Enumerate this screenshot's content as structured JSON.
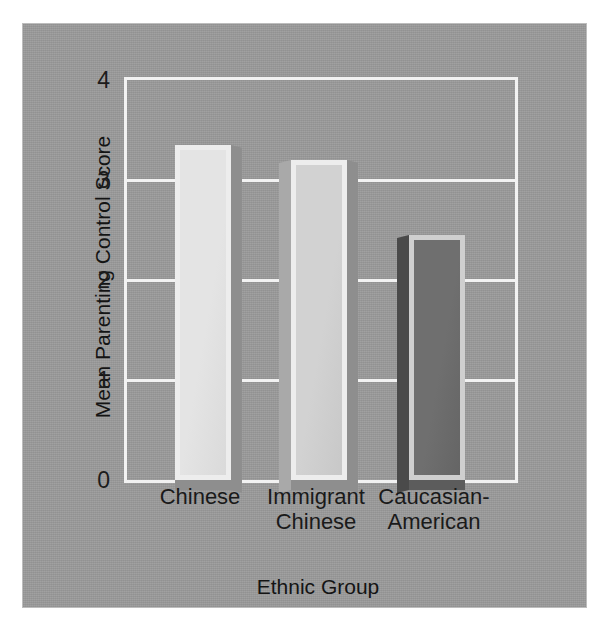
{
  "chart_data": {
    "type": "bar",
    "title": "",
    "xlabel": "Ethnic Group",
    "ylabel": "Mean Parenting Control Score",
    "categories": [
      "Chinese",
      "Immigrant\nChinese",
      "Caucasian-\nAmerican"
    ],
    "values": [
      3.35,
      3.2,
      2.45
    ],
    "ylim": [
      0,
      4
    ],
    "yticks": [
      0,
      1,
      2,
      3,
      4
    ],
    "ytick_labels": [
      "0",
      "1",
      "2",
      "3",
      "4"
    ],
    "grid": true,
    "gridline_values": [
      1,
      2,
      3
    ],
    "legend": null,
    "legend_position": "none",
    "bar_colors": [
      "#e4e4e4",
      "#d2d2d2",
      "#6f6f6f"
    ],
    "bar_edge_color": "#ededed",
    "background_color": "#9b9b9b",
    "axis_color": "#f2f2f2",
    "text_color": "#1a1a1a",
    "style": "3d-bar"
  }
}
